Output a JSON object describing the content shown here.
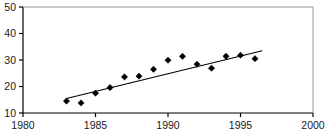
{
  "chart_data": {
    "type": "scatter",
    "title": "",
    "subtitle": "",
    "xlabel": "",
    "ylabel": "",
    "xlim": [
      1980,
      2000
    ],
    "ylim": [
      10,
      50
    ],
    "grid": false,
    "legend": null,
    "x_ticks": [
      1980,
      1985,
      1990,
      1995,
      2000
    ],
    "y_ticks": [
      10,
      20,
      30,
      40,
      50
    ],
    "x_tick_labels": [
      "1980",
      "1985",
      "1990",
      "1995",
      "2000"
    ],
    "y_tick_labels": [
      "10",
      "20",
      "30",
      "40",
      "50"
    ],
    "marker": "diamond",
    "marker_color": "#000000",
    "line_color": "#000000",
    "axis_color": "#000000",
    "series": [
      {
        "name": "observations",
        "type": "scatter",
        "x": [
          1983,
          1984,
          1985,
          1986,
          1987,
          1988,
          1989,
          1990,
          1991,
          1992,
          1993,
          1994,
          1995,
          1996
        ],
        "values": [
          14.5,
          13.8,
          17.5,
          19.6,
          23.6,
          23.9,
          26.5,
          29.9,
          31.4,
          28.4,
          26.9,
          31.4,
          31.8,
          30.5
        ]
      },
      {
        "name": "trend-line",
        "type": "line",
        "x": [
          1983.0,
          1996.5
        ],
        "values": [
          15.5,
          33.5
        ]
      }
    ]
  },
  "axes": {
    "x_axis_name": "x-axis",
    "y_axis_name": "y-axis"
  }
}
